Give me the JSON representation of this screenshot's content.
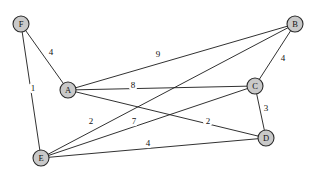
{
  "diagram": {
    "type": "node-link-graph",
    "width": 317,
    "height": 177,
    "node_fill": "#c9c9c9",
    "node_stroke": "#2a2a2a",
    "edge_color": "#1a1a1a",
    "background": "#ffffff",
    "nodes": [
      {
        "id": "F",
        "label": "F",
        "x": 21,
        "y": 24,
        "r": 8
      },
      {
        "id": "B",
        "label": "B",
        "x": 295,
        "y": 24,
        "r": 8
      },
      {
        "id": "A",
        "label": "A",
        "x": 68,
        "y": 90,
        "r": 8
      },
      {
        "id": "C",
        "label": "C",
        "x": 255,
        "y": 86,
        "r": 8
      },
      {
        "id": "D",
        "label": "D",
        "x": 266,
        "y": 138,
        "r": 8
      },
      {
        "id": "E",
        "label": "E",
        "x": 41,
        "y": 158,
        "r": 8
      }
    ],
    "edges": [
      {
        "from": "F",
        "to": "A",
        "weight": "4",
        "lx": 51,
        "ly": 52
      },
      {
        "from": "F",
        "to": "E",
        "weight": "1",
        "lx": 33,
        "ly": 88
      },
      {
        "from": "A",
        "to": "B",
        "weight": "9",
        "lx": 158,
        "ly": 54
      },
      {
        "from": "A",
        "to": "C",
        "weight": "8",
        "lx": 133,
        "ly": 85
      },
      {
        "from": "A",
        "to": "D",
        "weight": "2",
        "lx": 208,
        "ly": 121
      },
      {
        "from": "E",
        "to": "C",
        "weight": "2",
        "lx": 91,
        "ly": 121
      },
      {
        "from": "E",
        "to": "B",
        "weight": "7",
        "lx": 134,
        "ly": 121
      },
      {
        "from": "E",
        "to": "D",
        "weight": "4",
        "lx": 148,
        "ly": 143
      },
      {
        "from": "B",
        "to": "C",
        "weight": "4",
        "lx": 283,
        "ly": 58
      },
      {
        "from": "C",
        "to": "D",
        "weight": "3",
        "lx": 266,
        "ly": 108
      }
    ]
  }
}
